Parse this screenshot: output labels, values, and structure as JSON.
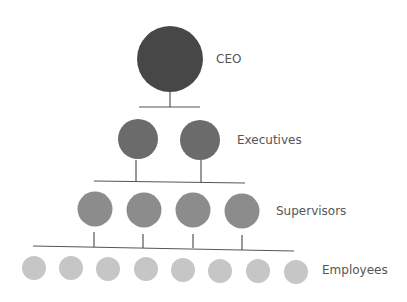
{
  "diagram": {
    "type": "organizational-hierarchy",
    "levels": [
      {
        "label": "CEO",
        "count": 1,
        "color": "#474747"
      },
      {
        "label": "Executives",
        "count": 2,
        "color": "#6b6b6b"
      },
      {
        "label": "Supervisors",
        "count": 4,
        "color": "#8c8c8c"
      },
      {
        "label": "Employees",
        "count": 8,
        "color": "#c6c6c6"
      }
    ]
  }
}
